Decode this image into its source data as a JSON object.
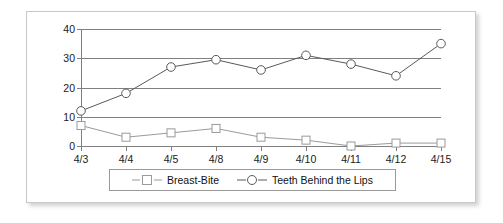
{
  "chart_data": {
    "type": "line",
    "title": "",
    "subtitle": "",
    "xlabel": "",
    "ylabel": "",
    "categories": [
      "4/3",
      "4/4",
      "4/5",
      "4/8",
      "4/9",
      "4/10",
      "4/11",
      "4/12",
      "4/15"
    ],
    "ylim": [
      0,
      40
    ],
    "yticks": [
      0,
      10,
      20,
      30,
      40
    ],
    "ytick_labels": [
      "0",
      "10",
      "20",
      "30",
      "40"
    ],
    "grid": true,
    "legend_position": "bottom",
    "series": [
      {
        "name": "Breast-Bite",
        "marker": "square",
        "color": "#9a9a9a",
        "values": [
          7,
          3,
          4.5,
          6,
          3,
          2,
          0,
          1,
          1
        ]
      },
      {
        "name": "Teeth Behind the Lips",
        "marker": "circle",
        "color": "#5a5a5a",
        "values": [
          12,
          18,
          27,
          29.5,
          26,
          31,
          28,
          24,
          35
        ]
      }
    ]
  },
  "legend": {
    "entries": [
      {
        "label": "Breast-Bite",
        "marker_icon": "square-marker-icon"
      },
      {
        "label": "Teeth Behind the Lips",
        "marker_icon": "circle-marker-icon"
      }
    ]
  },
  "colors": {
    "grid": "#808080",
    "axis": "#808080",
    "card_border": "#c9c9c9",
    "legend_border": "#9a9a9a",
    "series_breast_bite": "#9a9a9a",
    "series_teeth_behind_lips": "#5a5a5a",
    "background": "#ffffff",
    "text": "#1a1a1a"
  }
}
